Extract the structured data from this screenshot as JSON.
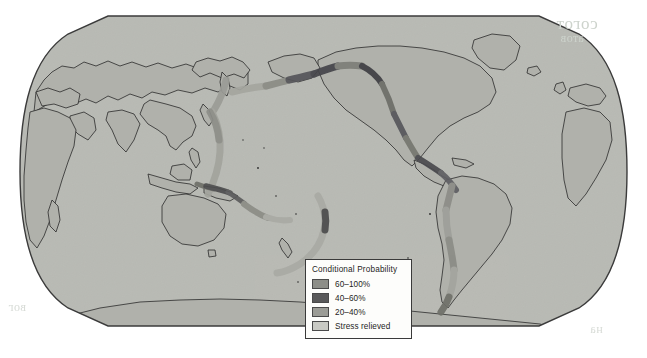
{
  "figure": {
    "kind": "world-map",
    "projection_shape": "rounded-stadium",
    "background_color": "#ffffff"
  },
  "map": {
    "ocean_color": "#b9bab4",
    "land_color": "#b0b1ab",
    "coastline_color": "#2b2b2b",
    "frame_color": "#3b3b3b",
    "title": "",
    "regions_with_bands": [
      "Kamchatka",
      "Kuril Islands",
      "Japan",
      "Izu-Bonin-Mariana Arc",
      "Philippines",
      "New Guinea",
      "Solomon Islands",
      "Vanuatu",
      "Tonga-Kermadec Arc",
      "New Zealand",
      "Aleutian Islands",
      "Alaska",
      "Cascadia",
      "California",
      "Mexico",
      "Central America",
      "Colombia-Ecuador",
      "Peru",
      "Chile"
    ]
  },
  "legend": {
    "title": "Conditional Probability",
    "items": [
      {
        "label": "60–100%",
        "color": "#8d8e88",
        "name": "legend-swatch-60-100"
      },
      {
        "label": "40–60%",
        "color": "#59595a",
        "name": "legend-swatch-40-60"
      },
      {
        "label": "20–40%",
        "color": "#9b9c96",
        "name": "legend-swatch-20-40"
      },
      {
        "label": "Stress relieved",
        "color": "#c9cac4",
        "name": "legend-swatch-stress-relieved"
      }
    ]
  },
  "chart_data": {
    "type": "map",
    "title": "Conditional Probability",
    "value_field": "conditional_probability",
    "classes": [
      {
        "label": "60–100%",
        "range": [
          60,
          100
        ],
        "color": "#8d8e88"
      },
      {
        "label": "40–60%",
        "range": [
          40,
          60
        ],
        "color": "#59595a"
      },
      {
        "label": "20–40%",
        "range": [
          20,
          40
        ],
        "color": "#9b9c96"
      },
      {
        "label": "Stress relieved",
        "range": null,
        "color": "#c9cac4"
      }
    ],
    "segments": [
      {
        "region": "Kamchatka",
        "class": "20–40%"
      },
      {
        "region": "Kuril Islands",
        "class": "Stress relieved"
      },
      {
        "region": "Japan Trench",
        "class": "20–40%"
      },
      {
        "region": "Izu-Bonin Arc",
        "class": "20–40%"
      },
      {
        "region": "Mariana Arc",
        "class": "Stress relieved"
      },
      {
        "region": "New Guinea",
        "class": "40–60%"
      },
      {
        "region": "Solomon Islands",
        "class": "40–60%"
      },
      {
        "region": "Vanuatu",
        "class": "20–40%"
      },
      {
        "region": "Tonga Arc",
        "class": "Stress relieved"
      },
      {
        "region": "Kermadec Arc",
        "class": "40–60%"
      },
      {
        "region": "New Zealand",
        "class": "20–40%"
      },
      {
        "region": "Western Aleutians",
        "class": "20–40%"
      },
      {
        "region": "Central Aleutians",
        "class": "60–100%"
      },
      {
        "region": "Eastern Aleutians",
        "class": "40–60%"
      },
      {
        "region": "Alaska Peninsula",
        "class": "40–60%"
      },
      {
        "region": "Gulf of Alaska",
        "class": "60–100%"
      },
      {
        "region": "Cascadia",
        "class": "20–40%"
      },
      {
        "region": "California",
        "class": "40–60%"
      },
      {
        "region": "Baja California",
        "class": "20–40%"
      },
      {
        "region": "Mexico Trench",
        "class": "60–100%"
      },
      {
        "region": "Central America",
        "class": "40–60%"
      },
      {
        "region": "Colombia-Ecuador",
        "class": "20–40%"
      },
      {
        "region": "Northern Peru",
        "class": "60–100%"
      },
      {
        "region": "Southern Peru",
        "class": "20–40%"
      },
      {
        "region": "Northern Chile",
        "class": "60–100%"
      },
      {
        "region": "Central Chile",
        "class": "20–40%"
      },
      {
        "region": "Southern Chile",
        "class": "40–60%"
      }
    ],
    "legend_position": "lower-center-right",
    "grid": false
  },
  "artifacts": {
    "bleed_text_1": "согот",
    "bleed_text_2": "атов",
    "bleed_text_3": "вог",
    "bleed_text_4": "на"
  }
}
